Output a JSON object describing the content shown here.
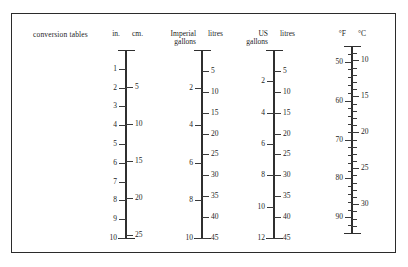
{
  "figure": {
    "caption": "conversion tables",
    "background": "#ffffff",
    "ink": "#2b2b2b"
  },
  "chart_data": {
    "type": "table",
    "title": "conversion tables",
    "layout": {
      "grid": false,
      "legend": "none",
      "orientation": "vertical",
      "scale_count": 4
    },
    "scales": [
      {
        "name": "length",
        "left_unit": "in.",
        "right_unit": "cm.",
        "left_label_lines": [
          "in."
        ],
        "right_label_lines": [
          "cm."
        ],
        "left_range": [
          0,
          10
        ],
        "right_range": [
          0,
          25.4
        ],
        "left_ticks": [
          {
            "value": 1,
            "label": "1"
          },
          {
            "value": 2,
            "label": "2"
          },
          {
            "value": 3,
            "label": "3"
          },
          {
            "value": 4,
            "label": "4"
          },
          {
            "value": 5,
            "label": "5"
          },
          {
            "value": 6,
            "label": "6"
          },
          {
            "value": 7,
            "label": "7"
          },
          {
            "value": 8,
            "label": "8"
          },
          {
            "value": 9,
            "label": "9"
          },
          {
            "value": 10,
            "label": "10"
          }
        ],
        "right_ticks": [
          {
            "value": 5,
            "label": "5"
          },
          {
            "value": 10,
            "label": "10"
          },
          {
            "value": 15,
            "label": "15"
          },
          {
            "value": 20,
            "label": "20"
          },
          {
            "value": 25,
            "label": "25"
          }
        ],
        "equivalences": [
          {
            "left": 2,
            "right": 5
          },
          {
            "left": 4,
            "right": 10
          },
          {
            "left": 6,
            "right": 15
          },
          {
            "left": 8,
            "right": 20
          },
          {
            "left": 10,
            "right": 25
          }
        ]
      },
      {
        "name": "imperial-volume",
        "left_unit": "Imperial gallons",
        "right_unit": "litres",
        "left_label_lines": [
          "Imperial",
          "gallons"
        ],
        "right_label_lines": [
          "litres"
        ],
        "left_range": [
          0,
          10
        ],
        "right_range": [
          0,
          45
        ],
        "left_ticks": [
          {
            "value": 2,
            "label": "2"
          },
          {
            "value": 4,
            "label": "4"
          },
          {
            "value": 6,
            "label": "6"
          },
          {
            "value": 8,
            "label": "8"
          },
          {
            "value": 10,
            "label": "10"
          }
        ],
        "right_ticks": [
          {
            "value": 5,
            "label": "5"
          },
          {
            "value": 10,
            "label": "10"
          },
          {
            "value": 15,
            "label": "15"
          },
          {
            "value": 20,
            "label": "20"
          },
          {
            "value": 25,
            "label": "25"
          },
          {
            "value": 30,
            "label": "30"
          },
          {
            "value": 35,
            "label": "35"
          },
          {
            "value": 40,
            "label": "40"
          },
          {
            "value": 45,
            "label": "45"
          }
        ],
        "equivalences": [
          {
            "left": 2,
            "right": 9
          },
          {
            "left": 4,
            "right": 18
          },
          {
            "left": 6,
            "right": 27
          },
          {
            "left": 8,
            "right": 36
          },
          {
            "left": 10,
            "right": 45
          }
        ]
      },
      {
        "name": "us-volume",
        "left_unit": "US gallons",
        "right_unit": "litres",
        "left_label_lines": [
          "US",
          "gallons"
        ],
        "right_label_lines": [
          "litres"
        ],
        "left_range": [
          0,
          12
        ],
        "right_range": [
          0,
          45
        ],
        "left_ticks": [
          {
            "value": 2,
            "label": "2"
          },
          {
            "value": 4,
            "label": "4"
          },
          {
            "value": 6,
            "label": "6"
          },
          {
            "value": 8,
            "label": "8"
          },
          {
            "value": 10,
            "label": "10"
          },
          {
            "value": 12,
            "label": "12"
          }
        ],
        "right_ticks": [
          {
            "value": 5,
            "label": "5"
          },
          {
            "value": 10,
            "label": "10"
          },
          {
            "value": 15,
            "label": "15"
          },
          {
            "value": 20,
            "label": "20"
          },
          {
            "value": 25,
            "label": "25"
          },
          {
            "value": 30,
            "label": "30"
          },
          {
            "value": 35,
            "label": "35"
          },
          {
            "value": 40,
            "label": "40"
          },
          {
            "value": 45,
            "label": "45"
          }
        ],
        "equivalences": [
          {
            "left": 2,
            "right": 7.5
          },
          {
            "left": 4,
            "right": 15
          },
          {
            "left": 6,
            "right": 22.5
          },
          {
            "left": 8,
            "right": 30
          },
          {
            "left": 10,
            "right": 37.5
          },
          {
            "left": 12,
            "right": 45
          }
        ]
      },
      {
        "name": "temperature",
        "left_unit": "°F",
        "right_unit": "°C",
        "left_label_lines": [
          "°F"
        ],
        "right_label_lines": [
          "°C"
        ],
        "left_range": [
          46,
          94
        ],
        "right_range": [
          8,
          34
        ],
        "left_ticks": [
          {
            "value": 50,
            "label": "50"
          },
          {
            "value": 60,
            "label": "60"
          },
          {
            "value": 70,
            "label": "70"
          },
          {
            "value": 80,
            "label": "80"
          },
          {
            "value": 90,
            "label": "90"
          }
        ],
        "left_minor_step": 2,
        "right_ticks": [
          {
            "value": 10,
            "label": "10"
          },
          {
            "value": 15,
            "label": "15"
          },
          {
            "value": 20,
            "label": "20"
          },
          {
            "value": 25,
            "label": "25"
          },
          {
            "value": 30,
            "label": "30"
          }
        ],
        "right_minor_step": 1,
        "equivalences": [
          {
            "left": 50,
            "right": 10
          },
          {
            "left": 59,
            "right": 15
          },
          {
            "left": 68,
            "right": 20
          },
          {
            "left": 77,
            "right": 25
          },
          {
            "left": 86,
            "right": 30
          }
        ]
      }
    ]
  },
  "geometry": {
    "scales": [
      {
        "x": 126,
        "top": 50,
        "bottom": 238,
        "head_y": 30
      },
      {
        "x": 202,
        "top": 50,
        "bottom": 238,
        "head_y": 30
      },
      {
        "x": 274,
        "top": 50,
        "bottom": 238,
        "head_y": 30
      },
      {
        "x": 352,
        "top": 46,
        "bottom": 233,
        "head_y": 30
      }
    ]
  }
}
